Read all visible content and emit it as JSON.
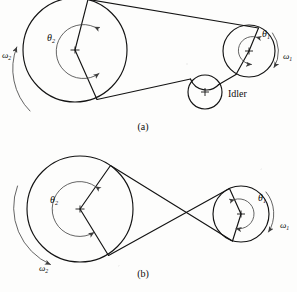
{
  "figure": {
    "background_color": "#fdfdfc",
    "ink_color": "#131313",
    "panels": [
      {
        "id": "a",
        "caption": "(a)",
        "caption_x": 143,
        "caption_y": 130,
        "type": "open-belt-with-idler",
        "labels": {
          "theta_large": "θ",
          "theta_large_sub": "2",
          "theta_small": "θ",
          "theta_small_sub": "1",
          "omega_large": "ω",
          "omega_large_sub": "2",
          "omega_small": "ω",
          "omega_small_sub": "1",
          "idler": "Idler"
        },
        "pulleys": [
          {
            "name": "driven-large-pulley",
            "cx": 75,
            "cy": 50,
            "r": 52
          },
          {
            "name": "driver-small-pulley",
            "cx": 249,
            "cy": 51,
            "r": 26
          },
          {
            "name": "idler-pulley",
            "cx": 205,
            "cy": 92,
            "r": 17
          }
        ]
      },
      {
        "id": "b",
        "caption": "(b)",
        "caption_x": 143,
        "caption_y": 277,
        "type": "crossed-belt",
        "labels": {
          "theta_large": "θ",
          "theta_large_sub": "2",
          "theta_small": "θ",
          "theta_small_sub": "1",
          "omega_large": "ω",
          "omega_large_sub": "2",
          "omega_small": "ω",
          "omega_small_sub": "1"
        },
        "pulleys": [
          {
            "name": "driven-large-pulley",
            "cx": 80,
            "cy": 209,
            "r": 53
          },
          {
            "name": "driver-small-pulley",
            "cx": 241,
            "cy": 214,
            "r": 28
          }
        ]
      }
    ]
  },
  "text_positions": {
    "a_theta2": {
      "x": 47,
      "y": 41
    },
    "a_theta1": {
      "x": 262,
      "y": 37
    },
    "a_omega2": {
      "x": 3,
      "y": 57
    },
    "a_omega1": {
      "x": 284,
      "y": 58
    },
    "a_idler": {
      "x": 228,
      "y": 97
    },
    "b_theta2": {
      "x": 51,
      "y": 202
    },
    "b_theta1": {
      "x": 258,
      "y": 200
    },
    "b_omega2": {
      "x": 40,
      "y": 270
    },
    "b_omega1": {
      "x": 281,
      "y": 227
    }
  }
}
